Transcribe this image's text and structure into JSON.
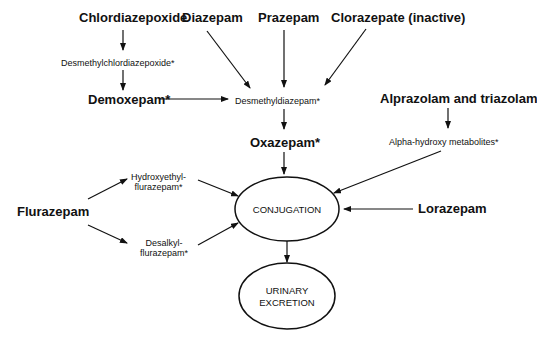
{
  "diagram": {
    "title": "",
    "nodes": [
      {
        "id": "chlordiazepoxide",
        "label": "Chlordiazepoxide",
        "style": "bold",
        "x": 79,
        "y": 11
      },
      {
        "id": "diazepam",
        "label": "Diazepam",
        "style": "bold",
        "x": 182,
        "y": 11
      },
      {
        "id": "prazepam",
        "label": "Prazepam",
        "style": "bold",
        "x": 258,
        "y": 11
      },
      {
        "id": "clorazepate",
        "label": "Clorazepate (inactive)",
        "style": "bold",
        "x": 331,
        "y": 11
      },
      {
        "id": "desmethylchlordiazepoxide",
        "label": "Desmethylchlordiazepoxide*",
        "style": "small",
        "x": 61,
        "y": 58
      },
      {
        "id": "demoxepam",
        "label": "Demoxepam*",
        "style": "bold",
        "x": 88,
        "y": 93
      },
      {
        "id": "desmethyldiazepam",
        "label": "Desmethyldiazepam*",
        "style": "small",
        "x": 235,
        "y": 96
      },
      {
        "id": "alprazolam_triazolam",
        "label": "Alprazolam and triazolam",
        "style": "bold",
        "x": 380,
        "y": 92
      },
      {
        "id": "oxazepam",
        "label": "Oxazepam*",
        "style": "bold",
        "x": 250,
        "y": 136
      },
      {
        "id": "alpha_hydroxy",
        "label": "Alpha-hydroxy metabolites*",
        "style": "small",
        "x": 389,
        "y": 137
      },
      {
        "id": "hydroxyethylflurazepam",
        "label": "Hydroxyethyl-\nflurazepam*",
        "style": "small",
        "x": 131,
        "y": 172
      },
      {
        "id": "flurazepam",
        "label": "Flurazepam",
        "style": "bold",
        "x": 17,
        "y": 205
      },
      {
        "id": "lorazepam",
        "label": "Lorazepam",
        "style": "bold",
        "x": 418,
        "y": 202
      },
      {
        "id": "desalkylflurazepam",
        "label": "Desalkyl-\nflurazepam*",
        "style": "small",
        "x": 140,
        "y": 238
      }
    ],
    "ellipses": [
      {
        "id": "conjugation",
        "label": "CONJUGATION",
        "cx": 287,
        "cy": 209,
        "rx": 52,
        "ry": 32
      },
      {
        "id": "urinary_excretion",
        "label": "URINARY\nEXCRETION",
        "cx": 287,
        "cy": 296,
        "rx": 48,
        "ry": 33
      }
    ],
    "edges": [
      {
        "from": "chlordiazepoxide",
        "to": "desmethylchlordiazepoxide",
        "x1": 123,
        "y1": 30,
        "x2": 123,
        "y2": 50
      },
      {
        "from": "desmethylchlordiazepoxide",
        "to": "demoxepam",
        "x1": 123,
        "y1": 70,
        "x2": 123,
        "y2": 90
      },
      {
        "from": "demoxepam",
        "to": "desmethyldiazepam",
        "x1": 160,
        "y1": 99,
        "x2": 228,
        "y2": 99
      },
      {
        "from": "diazepam",
        "to": "desmethyldiazepam",
        "x1": 207,
        "y1": 31,
        "x2": 250,
        "y2": 88
      },
      {
        "from": "prazepam",
        "to": "desmethyldiazepam",
        "x1": 284,
        "y1": 30,
        "x2": 284,
        "y2": 87
      },
      {
        "from": "clorazepate",
        "to": "desmethyldiazepam",
        "x1": 366,
        "y1": 29,
        "x2": 325,
        "y2": 85
      },
      {
        "from": "desmethyldiazepam",
        "to": "oxazepam",
        "x1": 284,
        "y1": 109,
        "x2": 284,
        "y2": 129
      },
      {
        "from": "alprazolam_triazolam",
        "to": "alpha_hydroxy",
        "x1": 448,
        "y1": 108,
        "x2": 448,
        "y2": 128
      },
      {
        "from": "oxazepam",
        "to": "conjugation",
        "x1": 284,
        "y1": 152,
        "x2": 284,
        "y2": 174
      },
      {
        "from": "alpha_hydroxy",
        "to": "conjugation",
        "x1": 441,
        "y1": 151,
        "x2": 334,
        "y2": 193
      },
      {
        "from": "lorazepam",
        "to": "conjugation",
        "x1": 413,
        "y1": 209,
        "x2": 344,
        "y2": 209
      },
      {
        "from": "flurazepam",
        "to": "hydroxyethylflurazepam",
        "x1": 88,
        "y1": 199,
        "x2": 127,
        "y2": 179
      },
      {
        "from": "flurazepam",
        "to": "desalkylflurazepam",
        "x1": 88,
        "y1": 225,
        "x2": 127,
        "y2": 243
      },
      {
        "from": "hydroxyethylflurazepam",
        "to": "conjugation",
        "x1": 198,
        "y1": 180,
        "x2": 238,
        "y2": 196
      },
      {
        "from": "desalkylflurazepam",
        "to": "conjugation",
        "x1": 198,
        "y1": 245,
        "x2": 238,
        "y2": 223
      },
      {
        "from": "conjugation",
        "to": "urinary_excretion",
        "x1": 287,
        "y1": 241,
        "x2": 287,
        "y2": 262
      }
    ],
    "colors": {
      "ink": "#111111",
      "background": "#ffffff"
    }
  }
}
